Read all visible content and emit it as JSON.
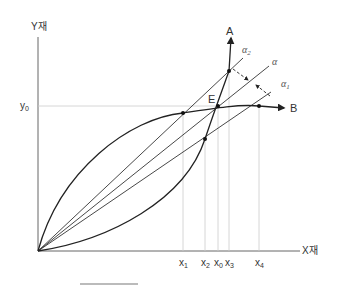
{
  "axes": {
    "y_label": "Y재",
    "x_label": "X재",
    "y0_label": "y",
    "y0_sub": "0"
  },
  "curves": {
    "A_label": "A",
    "B_label": "B",
    "equilibrium_label": "E"
  },
  "rays": {
    "alpha": "α",
    "alpha1": "α",
    "alpha1_sub": "1",
    "alpha2": "α",
    "alpha2_sub": "2"
  },
  "x_ticks": [
    {
      "base": "x",
      "sub": "1"
    },
    {
      "base": "x",
      "sub": "2"
    },
    {
      "base": "x",
      "sub": "0"
    },
    {
      "base": "x",
      "sub": "3"
    },
    {
      "base": "x",
      "sub": "4"
    }
  ]
}
